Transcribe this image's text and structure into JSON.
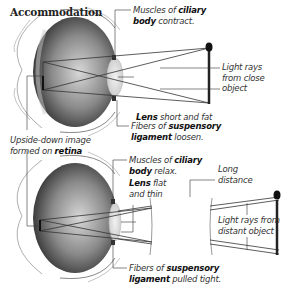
{
  "title": "Accommodation",
  "top_panel": {
    "scenario": "close object",
    "labels": {
      "ciliary_contract": {
        "pre": "Muscles of ",
        "bold": "ciliary",
        "line2_bold": "body",
        "line2": " contract."
      },
      "lens": {
        "bold": "Lens",
        "text": " short and fat"
      },
      "fibers": {
        "pre": "Fibers of ",
        "bold": "suspensory",
        "line2_bold": "ligament",
        "line2": " loosen."
      },
      "light_rays": {
        "l1": "Light rays",
        "l2": "from close",
        "l3": "object"
      }
    }
  },
  "middle_label": {
    "l1": "Upside-down image",
    "l2_pre": "formed on ",
    "l2_bold": "retina"
  },
  "bottom_panel": {
    "scenario": "distant object",
    "labels": {
      "ciliary_relax": {
        "pre": "Muscles of ",
        "bold": "ciliary",
        "line2_bold": "body",
        "line2": " relax."
      },
      "lens": {
        "bold": "Lens",
        "text": " flat",
        "line2": "and thin"
      },
      "fibers": {
        "pre": "Fibers of ",
        "bold": "suspensory",
        "line2_bold": "ligament",
        "line2": " pulled tight."
      },
      "long_distance": {
        "l1": "Long",
        "l2": "distance"
      },
      "light_rays": {
        "l1": "Light rays from",
        "l2": "distant object"
      }
    }
  },
  "colors": {
    "eyeball_dark": "#2a2a2a",
    "eyeball_light": "#d0d0d0",
    "lens": "#e4e4e4",
    "rays": "#444444",
    "object": "#222222"
  }
}
